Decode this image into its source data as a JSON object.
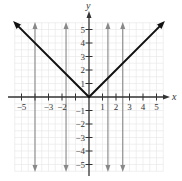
{
  "chart_data": {
    "type": "line",
    "title": "",
    "xlabel": "x",
    "ylabel": "y",
    "xlim": [
      -5.5,
      5.5
    ],
    "ylim": [
      -5.5,
      5.5
    ],
    "grid": true,
    "x_tick_labels": [
      "-5",
      "-3",
      "-2",
      "1",
      "2",
      "3",
      "4",
      "5"
    ],
    "y_tick_labels": [
      "5",
      "4",
      "3",
      "2",
      "1",
      "-1",
      "-2",
      "-3",
      "-4",
      "-5"
    ],
    "series": [
      {
        "name": "y = |x|",
        "style": "black thick line with arrows at both ends",
        "x": [
          -5.4,
          0,
          5.4
        ],
        "y": [
          5.4,
          0,
          5.4
        ]
      }
    ],
    "vertical_lines": [
      {
        "x": -4,
        "style": "gray line with arrows at both ends"
      },
      {
        "x": -1.7,
        "style": "gray line with arrows at both ends"
      },
      {
        "x": 1.4,
        "style": "gray line with arrows at both ends"
      },
      {
        "x": 2.5,
        "style": "gray line with arrows at both ends"
      }
    ]
  },
  "labels": {
    "x_axis": "x",
    "y_axis": "y"
  },
  "colors": {
    "grid": "#e6e6e6",
    "axis": "#333333",
    "curve": "#111111",
    "vertical_lines": "#888888"
  }
}
